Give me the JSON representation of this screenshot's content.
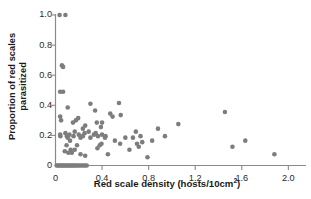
{
  "chart_data": {
    "type": "scatter",
    "title": "",
    "xlabel": "Red scale density (hosts/10cm²)",
    "ylabel_line1": "Proportion of red scales",
    "ylabel_line2": "parasitized",
    "xlim": [
      0,
      2.1
    ],
    "ylim": [
      0,
      1.0
    ],
    "xticks": [
      0,
      0.4,
      0.8,
      1.2,
      1.6,
      2.0
    ],
    "xticklabels": [
      "0",
      "0.4",
      "0.8",
      "1.2",
      "1.6",
      "2.0"
    ],
    "yticks": [
      0,
      0.2,
      0.4,
      0.6,
      0.8,
      1.0
    ],
    "yticklabels": [
      "0",
      "0.2",
      "0.4",
      "0.6",
      "0.8",
      "1.0"
    ],
    "grid": false,
    "legend": null,
    "marker_color": "#7d7d7d",
    "marker_size_px": 4.6,
    "axis_color": "#8a8a8a",
    "series": [
      {
        "name": "red scale samples",
        "points": [
          [
            0.035,
            1.0
          ],
          [
            0.085,
            1.0
          ],
          [
            0.055,
            0.665
          ],
          [
            0.065,
            0.655
          ],
          [
            0.04,
            0.49
          ],
          [
            0.065,
            0.49
          ],
          [
            0.04,
            0.325
          ],
          [
            0.048,
            0.3
          ],
          [
            0.105,
            0.385
          ],
          [
            0.15,
            0.285
          ],
          [
            0.175,
            0.3
          ],
          [
            0.195,
            0.315
          ],
          [
            0.235,
            0.245
          ],
          [
            0.255,
            0.265
          ],
          [
            0.3,
            0.41
          ],
          [
            0.34,
            0.365
          ],
          [
            0.355,
            0.285
          ],
          [
            0.39,
            0.255
          ],
          [
            0.4,
            0.285
          ],
          [
            0.425,
            0.185
          ],
          [
            0.47,
            0.345
          ],
          [
            0.49,
            0.325
          ],
          [
            0.545,
            0.415
          ],
          [
            0.56,
            0.335
          ],
          [
            0.04,
            0.205
          ],
          [
            0.042,
            0.195
          ],
          [
            0.085,
            0.215
          ],
          [
            0.098,
            0.195
          ],
          [
            0.105,
            0.185
          ],
          [
            0.12,
            0.205
          ],
          [
            0.125,
            0.165
          ],
          [
            0.155,
            0.195
          ],
          [
            0.165,
            0.225
          ],
          [
            0.2,
            0.205
          ],
          [
            0.215,
            0.185
          ],
          [
            0.235,
            0.195
          ],
          [
            0.25,
            0.215
          ],
          [
            0.285,
            0.225
          ],
          [
            0.3,
            0.185
          ],
          [
            0.33,
            0.205
          ],
          [
            0.345,
            0.215
          ],
          [
            0.365,
            0.195
          ],
          [
            0.4,
            0.205
          ],
          [
            0.43,
            0.195
          ],
          [
            0.095,
            0.135
          ],
          [
            0.13,
            0.105
          ],
          [
            0.165,
            0.105
          ],
          [
            0.185,
            0.135
          ],
          [
            0.215,
            0.075
          ],
          [
            0.255,
            0.065
          ],
          [
            0.08,
            0.095
          ],
          [
            0.11,
            0.085
          ],
          [
            0.14,
            0.085
          ],
          [
            0.36,
            0.115
          ],
          [
            0.38,
            0.135
          ],
          [
            0.395,
            0.145
          ],
          [
            0.45,
            0.075
          ],
          [
            0.51,
            0.165
          ],
          [
            0.555,
            0.145
          ],
          [
            0.6,
            0.185
          ],
          [
            0.635,
            0.105
          ],
          [
            0.665,
            0.185
          ],
          [
            0.69,
            0.225
          ],
          [
            0.7,
            0.145
          ],
          [
            0.715,
            0.125
          ],
          [
            0.73,
            0.195
          ],
          [
            0.745,
            0.155
          ],
          [
            0.79,
            0.055
          ],
          [
            0.83,
            0.165
          ],
          [
            0.88,
            0.245
          ],
          [
            0.94,
            0.195
          ],
          [
            1.055,
            0.275
          ],
          [
            1.455,
            0.355
          ],
          [
            1.52,
            0.125
          ],
          [
            1.63,
            0.165
          ],
          [
            1.88,
            0.075
          ],
          [
            0.01,
            0.0
          ],
          [
            0.022,
            0.0
          ],
          [
            0.033,
            0.0
          ],
          [
            0.045,
            0.0
          ],
          [
            0.057,
            0.0
          ],
          [
            0.068,
            0.0
          ],
          [
            0.08,
            0.0
          ],
          [
            0.092,
            0.0
          ],
          [
            0.104,
            0.0
          ],
          [
            0.116,
            0.0
          ],
          [
            0.128,
            0.0
          ],
          [
            0.14,
            0.0
          ],
          [
            0.152,
            0.0
          ],
          [
            0.165,
            0.0
          ],
          [
            0.178,
            0.0
          ],
          [
            0.192,
            0.0
          ],
          [
            0.206,
            0.0
          ],
          [
            0.222,
            0.0
          ],
          [
            0.238,
            0.0
          ],
          [
            0.254,
            0.0
          ],
          [
            0.268,
            0.0
          ]
        ]
      }
    ]
  }
}
